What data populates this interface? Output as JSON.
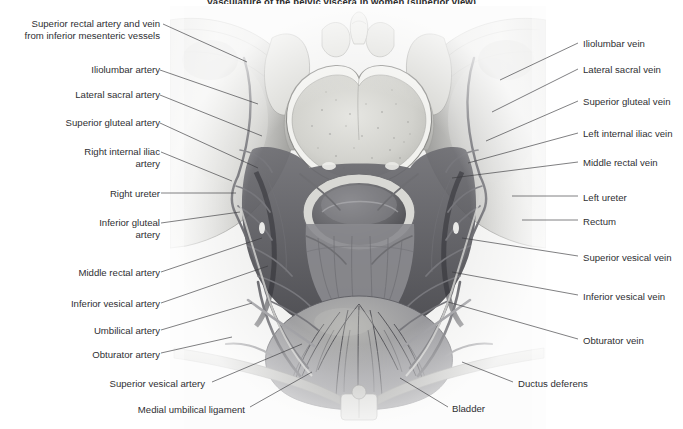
{
  "title": "Vasculature of the pelvic viscera in women (superior view)",
  "colors": {
    "text": "#2f2f33",
    "leader": "#3a3a3e",
    "background": "#ffffff",
    "bone_light": "#e8e8e6",
    "bone_mid": "#c9c9c6",
    "bone_dark": "#9a9a98",
    "vessel": "#6e6e72",
    "viscera": "#5c5c60",
    "shadow": "#3c3c40"
  },
  "illustration": {
    "name": "female-pelvis-superior-view",
    "structures": [
      "sacral promontory",
      "sacral ala",
      "iliac fossa",
      "rectum",
      "bladder",
      "pubic symphysis",
      "superior pubic ramus"
    ]
  },
  "labels": {
    "left": [
      {
        "id": "superior-rectal-artery-and-vein",
        "lines": [
          "Superior rectal artery and vein",
          "from inferior mesenteric vessels"
        ],
        "x": 10,
        "y": 18,
        "w": 150,
        "leader": [
          [
            163,
            24
          ],
          [
            247,
            62
          ]
        ]
      },
      {
        "id": "iliolumbar-artery",
        "lines": [
          "Iliolumbar artery"
        ],
        "x": 10,
        "y": 64,
        "w": 150,
        "leader": [
          [
            160,
            70
          ],
          [
            258,
            104
          ]
        ]
      },
      {
        "id": "lateral-sacral-artery",
        "lines": [
          "Lateral sacral artery"
        ],
        "x": 10,
        "y": 89,
        "w": 150,
        "leader": [
          [
            160,
            95
          ],
          [
            262,
            136
          ]
        ]
      },
      {
        "id": "superior-gluteal-artery",
        "lines": [
          "Superior gluteal artery"
        ],
        "x": 10,
        "y": 117,
        "w": 150,
        "leader": [
          [
            160,
            123
          ],
          [
            258,
            168
          ]
        ]
      },
      {
        "id": "right-internal-iliac-artery",
        "lines": [
          "Right internal iliac",
          "artery"
        ],
        "x": 10,
        "y": 146,
        "w": 150,
        "leader": [
          [
            161,
            152
          ],
          [
            232,
            181
          ]
        ]
      },
      {
        "id": "right-ureter",
        "lines": [
          "Right ureter"
        ],
        "x": 10,
        "y": 188,
        "w": 150,
        "leader": [
          [
            161,
            193
          ],
          [
            236,
            193
          ]
        ]
      },
      {
        "id": "inferior-gluteal-artery",
        "lines": [
          "Inferior gluteal",
          "artery"
        ],
        "x": 10,
        "y": 217,
        "w": 150,
        "leader": [
          [
            161,
            223
          ],
          [
            240,
            212
          ]
        ]
      },
      {
        "id": "middle-rectal-artery",
        "lines": [
          "Middle rectal artery"
        ],
        "x": 10,
        "y": 267,
        "w": 150,
        "leader": [
          [
            161,
            272
          ],
          [
            262,
            238
          ]
        ]
      },
      {
        "id": "inferior-vesical-artery",
        "lines": [
          "Inferior vesical artery"
        ],
        "x": 10,
        "y": 298,
        "w": 150,
        "leader": [
          [
            161,
            303
          ],
          [
            268,
            266
          ]
        ]
      },
      {
        "id": "umbilical-artery",
        "lines": [
          "Umbilical artery"
        ],
        "x": 10,
        "y": 325,
        "w": 150,
        "leader": [
          [
            161,
            330
          ],
          [
            252,
            303
          ]
        ]
      },
      {
        "id": "obturator-artery",
        "lines": [
          "Obturator artery"
        ],
        "x": 10,
        "y": 349,
        "w": 150,
        "leader": [
          [
            161,
            353
          ],
          [
            232,
            337
          ]
        ]
      },
      {
        "id": "superior-vesical-artery",
        "lines": [
          "Superior vesical artery"
        ],
        "x": 55,
        "y": 378,
        "w": 150,
        "leader": [
          [
            212,
            382
          ],
          [
            302,
            344
          ]
        ]
      },
      {
        "id": "medial-umbilical-ligament",
        "lines": [
          "Medial umbilical ligament"
        ],
        "x": 55,
        "y": 404,
        "w": 190,
        "leader": [
          [
            250,
            407
          ],
          [
            312,
            372
          ]
        ]
      }
    ],
    "right": [
      {
        "id": "iliolumbar-vein",
        "lines": [
          "Iliolumbar vein"
        ],
        "x": 583,
        "y": 38,
        "w": 95,
        "leader": [
          [
            578,
            43
          ],
          [
            500,
            80
          ]
        ]
      },
      {
        "id": "lateral-sacral-vein",
        "lines": [
          "Lateral sacral vein"
        ],
        "x": 583,
        "y": 64,
        "w": 95,
        "leader": [
          [
            578,
            69
          ],
          [
            492,
            112
          ]
        ]
      },
      {
        "id": "superior-gluteal-vein",
        "lines": [
          "Superior gluteal vein"
        ],
        "x": 583,
        "y": 96,
        "w": 100,
        "leader": [
          [
            578,
            101
          ],
          [
            486,
            141
          ]
        ]
      },
      {
        "id": "left-internal-iliac-vein",
        "lines": [
          "Left internal iliac vein"
        ],
        "x": 583,
        "y": 128,
        "w": 100,
        "leader": [
          [
            578,
            133
          ],
          [
            468,
            163
          ]
        ]
      },
      {
        "id": "middle-rectal-vein",
        "lines": [
          "Middle rectal vein"
        ],
        "x": 583,
        "y": 157,
        "w": 95,
        "leader": [
          [
            578,
            162
          ],
          [
            452,
            178
          ]
        ]
      },
      {
        "id": "left-ureter",
        "lines": [
          "Left ureter"
        ],
        "x": 583,
        "y": 192,
        "w": 95,
        "leader": [
          [
            578,
            196
          ],
          [
            512,
            196
          ]
        ]
      },
      {
        "id": "rectum",
        "lines": [
          "Rectum"
        ],
        "x": 583,
        "y": 216,
        "w": 95,
        "leader": [
          [
            578,
            220
          ],
          [
            522,
            220
          ]
        ]
      },
      {
        "id": "superior-vesical-vein",
        "lines": [
          "Superior vesical vein"
        ],
        "x": 583,
        "y": 252,
        "w": 100,
        "leader": [
          [
            578,
            256
          ],
          [
            462,
            238
          ]
        ]
      },
      {
        "id": "inferior-vesical-vein",
        "lines": [
          "Inferior vesical vein"
        ],
        "x": 583,
        "y": 291,
        "w": 100,
        "leader": [
          [
            578,
            295
          ],
          [
            452,
            272
          ]
        ]
      },
      {
        "id": "obturator-vein",
        "lines": [
          "Obturator vein"
        ],
        "x": 583,
        "y": 335,
        "w": 95,
        "leader": [
          [
            578,
            339
          ],
          [
            448,
            302
          ]
        ]
      }
    ],
    "bottom": [
      {
        "id": "ductus-deferens",
        "lines": [
          "Ductus deferens"
        ],
        "x": 518,
        "y": 378,
        "w": 110,
        "leader": [
          [
            513,
            382
          ],
          [
            462,
            362
          ]
        ]
      },
      {
        "id": "bladder",
        "lines": [
          "Bladder"
        ],
        "x": 452,
        "y": 403,
        "w": 60,
        "leader": [
          [
            448,
            407
          ],
          [
            400,
            378
          ]
        ]
      }
    ]
  }
}
